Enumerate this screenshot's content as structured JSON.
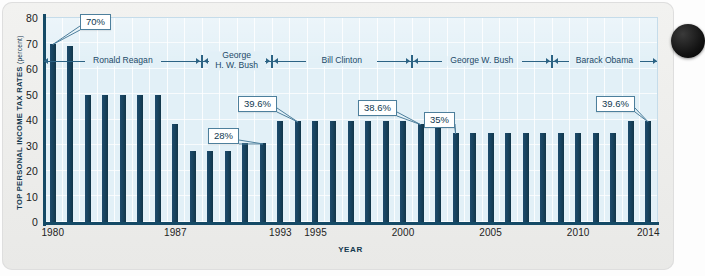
{
  "chart_data": {
    "type": "bar",
    "title": "",
    "xlabel": "YEAR",
    "ylabel": "TOP PERSONAL INCOME TAX RATES",
    "ylabel_unit": "(percent)",
    "ylim": [
      0,
      80
    ],
    "yticks": [
      0,
      10,
      20,
      30,
      40,
      50,
      60,
      70,
      80
    ],
    "xtick_labels": [
      "1980",
      "1987",
      "1993",
      "1995",
      "2000",
      "2005",
      "2010",
      "2014"
    ],
    "grid": true,
    "legend_position": "none",
    "bar_color": "#174360",
    "plot_background": "#e2f0f7",
    "categories": [
      1980,
      1981,
      1982,
      1983,
      1984,
      1985,
      1986,
      1987,
      1988,
      1989,
      1990,
      1991,
      1992,
      1993,
      1994,
      1995,
      1996,
      1997,
      1998,
      1999,
      2000,
      2001,
      2002,
      2003,
      2004,
      2005,
      2006,
      2007,
      2008,
      2009,
      2010,
      2011,
      2012,
      2013,
      2014
    ],
    "values": [
      70,
      69.1,
      50,
      50,
      50,
      50,
      50,
      38.5,
      28,
      28,
      28,
      31,
      31,
      39.6,
      39.6,
      39.6,
      39.6,
      39.6,
      39.6,
      39.6,
      39.6,
      38.6,
      38.6,
      35,
      35,
      35,
      35,
      35,
      35,
      35,
      35,
      35,
      35,
      39.6,
      39.6
    ]
  },
  "annotations": [
    {
      "label": "70%",
      "year": 1980,
      "value": 70
    },
    {
      "label": "28%",
      "year": 1992,
      "value": 31
    },
    {
      "label": "39.6%",
      "year": 1994,
      "value": 39.6
    },
    {
      "label": "38.6%",
      "year": 2001,
      "value": 38.6
    },
    {
      "label": "35%",
      "year": 2003,
      "value": 35
    },
    {
      "label": "39.6%",
      "year": 2014,
      "value": 39.6
    }
  ],
  "eras": [
    {
      "name": "Ronald Reagan",
      "start": 1980,
      "end": 1988
    },
    {
      "name": "George H. W. Bush",
      "start": 1989,
      "end": 1992
    },
    {
      "name": "Bill Clinton",
      "start": 1993,
      "end": 2000
    },
    {
      "name": "George W. Bush",
      "start": 2001,
      "end": 2008
    },
    {
      "name": "Barack Obama",
      "start": 2009,
      "end": 2014
    }
  ]
}
